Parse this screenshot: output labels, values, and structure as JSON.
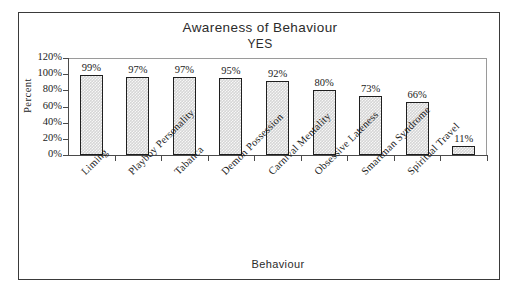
{
  "chart_data": {
    "type": "bar",
    "title": "Awareness of Behaviour",
    "subtitle": "YES",
    "xlabel": "Behaviour",
    "ylabel": "Percent",
    "ylim": [
      0,
      120
    ],
    "ytick_labels": [
      "120%",
      "100%",
      "80%",
      "60%",
      "40%",
      "20%",
      "0%"
    ],
    "ytick_values": [
      120,
      100,
      80,
      60,
      40,
      20,
      0
    ],
    "grid": false,
    "legend": "none",
    "categories": [
      "Liming",
      "Playboy Personality",
      "Tabanca",
      "Demon Possession",
      "Carnival Mentality",
      "Obsessive Lateness",
      "Smartman Syndrome",
      "Spiritual Travel",
      ""
    ],
    "values": [
      99,
      97,
      97,
      95,
      92,
      80,
      73,
      66,
      11
    ],
    "value_labels": [
      "99%",
      "97%",
      "97%",
      "95%",
      "92%",
      "80%",
      "73%",
      "66%",
      "11%"
    ]
  },
  "style": {
    "bar_fill": "#d6d6d6",
    "bar_border": "#1f1f1f",
    "axis_color": "#4a4a4a",
    "frame_color": "#3a3a3a",
    "text_color": "#1a1a1a"
  }
}
